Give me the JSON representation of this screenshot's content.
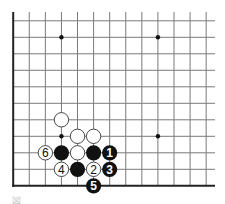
{
  "diagram": {
    "type": "go-board-fragment",
    "board_region": "lower-left corner",
    "columns": 13,
    "rows": 11,
    "colors": {
      "grid_line": "#7a7a7a",
      "edge_line": "#222222",
      "black_stone": "#111111",
      "white_stone": "#ffffff",
      "white_stone_outline": "#333333",
      "star_point": "#111111"
    },
    "star_points": [
      {
        "col": 3,
        "row": 9
      },
      {
        "col": 9,
        "row": 9
      },
      {
        "col": 3,
        "row": 3
      },
      {
        "col": 9,
        "row": 3
      }
    ],
    "stones": [
      {
        "color": "white",
        "col": 3,
        "row": 4,
        "label": ""
      },
      {
        "color": "white",
        "col": 4,
        "row": 3,
        "label": ""
      },
      {
        "color": "white",
        "col": 5,
        "row": 3,
        "label": ""
      },
      {
        "color": "white",
        "col": 2,
        "row": 2,
        "label": "6"
      },
      {
        "color": "black",
        "col": 3,
        "row": 2,
        "label": ""
      },
      {
        "color": "white",
        "col": 4,
        "row": 2,
        "label": ""
      },
      {
        "color": "black",
        "col": 5,
        "row": 2,
        "label": ""
      },
      {
        "color": "black",
        "col": 6,
        "row": 2,
        "label": "1"
      },
      {
        "color": "white",
        "col": 3,
        "row": 1,
        "label": "4"
      },
      {
        "color": "black",
        "col": 4,
        "row": 1,
        "label": ""
      },
      {
        "color": "white",
        "col": 5,
        "row": 1,
        "label": "2"
      },
      {
        "color": "black",
        "col": 6,
        "row": 1,
        "label": "3"
      },
      {
        "color": "black",
        "col": 5,
        "row": 0,
        "label": "5"
      }
    ]
  },
  "caption": "図"
}
